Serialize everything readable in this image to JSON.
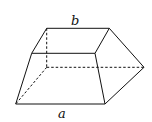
{
  "figure": {
    "type": "frustum-like solid (truncated wedge)",
    "labels": {
      "top_edge": "b",
      "bottom_edge": "a"
    },
    "colors": {
      "stroke": "#111111",
      "background": "#ffffff"
    }
  }
}
